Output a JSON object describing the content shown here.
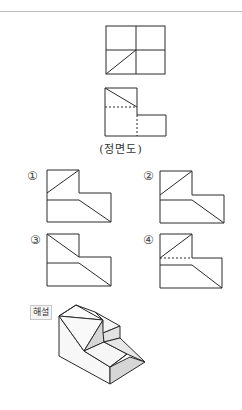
{
  "problem": {
    "top_view_label": "평면도",
    "front_view_caption": "(정면도)",
    "options": [
      {
        "number": "①",
        "label": "Option 1 — right side view candidate"
      },
      {
        "number": "②",
        "label": "Option 2 — right side view candidate"
      },
      {
        "number": "③",
        "label": "Option 3 — right side view candidate"
      },
      {
        "number": "④",
        "label": "Option 4 — right side view candidate"
      }
    ],
    "explanation_badge": "해설"
  },
  "colors": {
    "line": "#2a2a2a",
    "rule": "#bdbdbd",
    "shade": "#d6d6d6",
    "face": "#f7f7f7"
  }
}
